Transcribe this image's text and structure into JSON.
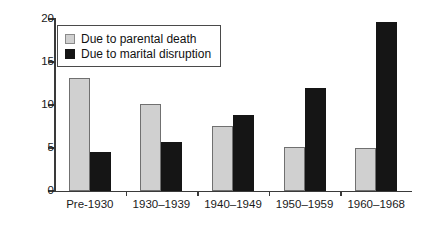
{
  "chart_data": {
    "type": "bar",
    "title": "",
    "subtitle": "",
    "xlabel": "",
    "ylabel": "",
    "categories": [
      "Pre-1930",
      "1930–1939",
      "1940–1949",
      "1950–1959",
      "1960–1968"
    ],
    "series": [
      {
        "name": "Due to parental death",
        "color": "#d0d0d0",
        "values": [
          13.1,
          10.1,
          7.6,
          5.1,
          5.0
        ]
      },
      {
        "name": "Due to marital disruption",
        "color": "#151515",
        "values": [
          4.5,
          5.7,
          8.8,
          12.0,
          19.7
        ]
      }
    ],
    "ylim": [
      0,
      20
    ],
    "yticks": [
      0,
      5,
      10,
      15,
      20
    ],
    "ytick_labels": [
      "0",
      "5",
      "10",
      "15",
      "20"
    ],
    "grid": false,
    "legend_position": "upper-left-inside",
    "annotations": []
  },
  "legend": {
    "items": [
      {
        "label": "Due to parental death",
        "swatch": "legend-swatch-grey"
      },
      {
        "label": "Due to marital disruption",
        "swatch": "legend-swatch-black"
      }
    ]
  },
  "colors": {
    "series_0": "#d0d0d0",
    "series_1": "#151515",
    "axis": "#3a3a3a",
    "background": "#ffffff"
  }
}
